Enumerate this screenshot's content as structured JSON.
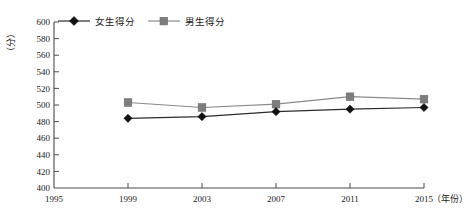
{
  "chart_data": {
    "type": "line",
    "title": "",
    "xlabel": "年份",
    "ylabel": "分",
    "x": [
      1995,
      1999,
      2003,
      2007,
      2011,
      2015
    ],
    "xtick_labels": [
      "1995",
      "1999",
      "2003",
      "2007",
      "2011",
      "2015"
    ],
    "xlim": [
      1995,
      2015
    ],
    "ylim": [
      400,
      600
    ],
    "ytick_labels": [
      "400",
      "420",
      "440",
      "460",
      "480",
      "500",
      "520",
      "540",
      "560",
      "580",
      "600"
    ],
    "ytick_values": [
      400,
      420,
      440,
      460,
      480,
      500,
      520,
      540,
      560,
      580,
      600
    ],
    "grid": false,
    "legend_position": "top-center",
    "series": [
      {
        "name": "女生得分",
        "marker": "diamond",
        "color": "#2b2b2b",
        "x": [
          1999,
          2003,
          2007,
          2011,
          2015
        ],
        "values": [
          484,
          486,
          492,
          495,
          497
        ]
      },
      {
        "name": "男生得分",
        "marker": "square",
        "color": "#8a8a8a",
        "x": [
          1999,
          2003,
          2007,
          2011,
          2015
        ],
        "values": [
          503,
          497,
          501,
          510,
          507
        ]
      }
    ]
  },
  "axis": {
    "y_unit_label": "（分）",
    "x_unit_label": "（年份）"
  },
  "legend": {
    "items": [
      {
        "label": "女生得分",
        "marker": "diamond-marker-icon"
      },
      {
        "label": "男生得分",
        "marker": "square-marker-icon"
      }
    ]
  },
  "ticks": {
    "y": [
      "600",
      "580",
      "560",
      "540",
      "520",
      "500",
      "480",
      "460",
      "440",
      "420",
      "400"
    ],
    "x": [
      "1995",
      "1999",
      "2003",
      "2007",
      "2011",
      "2015"
    ]
  }
}
